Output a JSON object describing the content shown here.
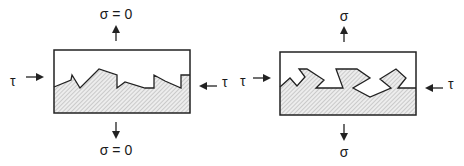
{
  "panels": [
    {
      "id": "left",
      "top_label": "σ = 0",
      "bottom_label": "σ = 0",
      "left_label": "τ",
      "right_label": "τ",
      "interface": "sawtooth-asperities"
    },
    {
      "id": "right",
      "top_label": "σ",
      "bottom_label": "σ",
      "left_label": "τ",
      "right_label": "τ",
      "interface": "interlocking-asperities"
    }
  ],
  "colors": {
    "stroke": "#222222",
    "hatch": "#9a9a9a",
    "fill_bg": "#ececec"
  }
}
